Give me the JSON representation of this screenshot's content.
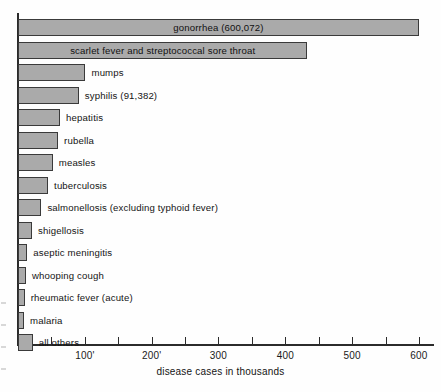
{
  "chart_data": {
    "type": "bar",
    "orientation": "horizontal",
    "title": "",
    "xlabel": "disease cases in thousands",
    "ylabel": "",
    "xlim": [
      0,
      625
    ],
    "grid": false,
    "legend": null,
    "units": "thousands of cases",
    "tick_labels": [
      "100'",
      "200'",
      "300",
      "400",
      "500",
      "600"
    ],
    "tick_values": [
      100,
      200,
      300,
      400,
      500,
      600
    ],
    "minor_tick_values": [
      50,
      150,
      250,
      350,
      450,
      550
    ],
    "categories": [
      "gonorrhea",
      "scarlet fever and streptococcal sore throat",
      "mumps",
      "syphilis",
      "hepatitis",
      "rubella",
      "measles",
      "tuberculosis",
      "salmonellosis (excluding typhoid fever)",
      "shigellosis",
      "aseptic meningitis",
      "whooping cough",
      "rheumatic fever (acute)",
      "malaria",
      "all others"
    ],
    "values": [
      600,
      433,
      101,
      91,
      63,
      60,
      52,
      45,
      35,
      21,
      14,
      12,
      10,
      9,
      22
    ],
    "bars": [
      {
        "label": "gonorrhea (600,072)",
        "value": 600,
        "label_inside": true
      },
      {
        "label": "scarlet fever and streptococcal sore throat",
        "value": 433,
        "label_inside": true
      },
      {
        "label": "mumps",
        "value": 101,
        "label_inside": false
      },
      {
        "label": "syphilis (91,382)",
        "value": 91,
        "label_inside": false
      },
      {
        "label": "hepatitis",
        "value": 63,
        "label_inside": false
      },
      {
        "label": "rubella",
        "value": 60,
        "label_inside": false
      },
      {
        "label": "measles",
        "value": 52,
        "label_inside": false
      },
      {
        "label": "tuberculosis",
        "value": 45,
        "label_inside": false
      },
      {
        "label": "salmonellosis (excluding typhoid fever)",
        "value": 35,
        "label_inside": false
      },
      {
        "label": "shigellosis",
        "value": 21,
        "label_inside": false
      },
      {
        "label": "aseptic meningitis",
        "value": 14,
        "label_inside": false
      },
      {
        "label": "whooping cough",
        "value": 12,
        "label_inside": false
      },
      {
        "label": "rheumatic fever (acute)",
        "value": 10,
        "label_inside": false
      },
      {
        "label": "malaria",
        "value": 9,
        "label_inside": false
      },
      {
        "label": "all others",
        "value": 22,
        "label_inside": false
      }
    ],
    "colors": {
      "bar_fill": "#aaaaaa",
      "bar_stroke": "#3a3a3a",
      "axis": "#2b2b2b",
      "text": "#141414",
      "background": "#fefefe"
    }
  }
}
